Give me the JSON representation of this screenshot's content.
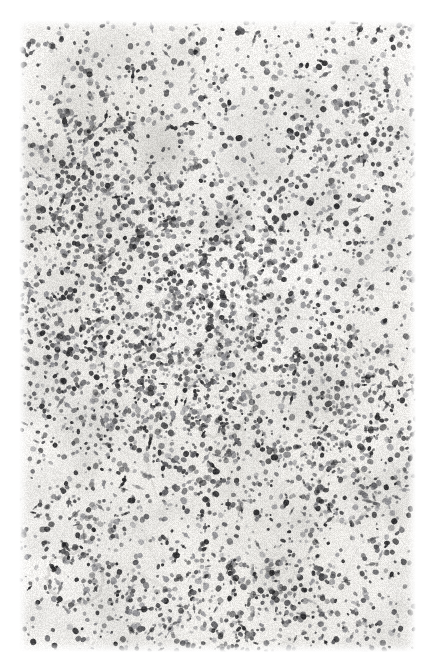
{
  "figure": {
    "domain": "Natural-Image",
    "kind": "histopathology-micrograph",
    "title": "Histological section photomicrograph",
    "description": "Low-power black-and-white photomicrograph of a haematoxylin-stained tissue section showing a diffuse mononuclear cell infiltrate with several rounded lymphoid follicle / granuloma-like aggregates.",
    "stain": "Haematoxylin and eosin (greyscale reproduction)",
    "visible_text": "",
    "label": ""
  },
  "canvas": {
    "width": 430,
    "height": 657,
    "page_background": "#ffffff",
    "slide_background": "#f7f6f4",
    "margins": {
      "left": 19,
      "right": 14,
      "top": 20,
      "bottom": 5
    }
  },
  "palette": {
    "page_white": "#ffffff",
    "slide_base": "#f6f5f3",
    "slide_warm_tint": "#f2f1ed",
    "nucleus_dark": "#2e2e30",
    "nucleus_mid": "#5e5e61",
    "nucleus_light": "#8e8e92",
    "stroma_haze": "#dedddb",
    "follicle_ring": "#cfcecb",
    "vessel_line": "#c4c3c0",
    "scan_streak": "#ecebe8"
  },
  "render": {
    "seed": 20240617,
    "nuclei_count": 5200,
    "haze_blob_count": 190,
    "fiber_count": 260,
    "grain_opacity": 0.055,
    "blur_px": 0.35
  },
  "features": [
    {
      "name": "follicle-upper-central",
      "type": "lymphoid-follicle",
      "cx": 186,
      "cy": 329,
      "r": 36,
      "ring_strength": 0.55,
      "center_density": 0.8,
      "note": "Rounded aggregate with pale centre and condensed rim of small dark nuclei"
    },
    {
      "name": "follicle-lower-central",
      "type": "granuloma-like-aggregate",
      "cx": 218,
      "cy": 404,
      "r": 34,
      "ring_strength": 0.45,
      "center_density": 1.25,
      "note": "Densely cellular nodular aggregate just below and right of the upper follicle"
    },
    {
      "name": "follicle-right-lower",
      "type": "lymphoid-follicle",
      "cx": 345,
      "cy": 494,
      "r": 30,
      "ring_strength": 0.5,
      "center_density": 0.75,
      "note": "Smaller ring-shaped aggregate in the lower right quadrant"
    },
    {
      "name": "follicle-mid-left",
      "type": "cell-aggregate",
      "cx": 120,
      "cy": 346,
      "r": 26,
      "ring_strength": 0.3,
      "center_density": 0.95,
      "note": "Ill-defined cluster at left of centre"
    },
    {
      "name": "vessel-lower-left",
      "type": "vessel-profile",
      "cx": 75,
      "cy": 578,
      "r": 28,
      "ring_strength": 0.6,
      "center_density": 0.25,
      "note": "Curved, nearly acellular vascular profile in sparse lower-left field"
    },
    {
      "name": "aggregate-upper-left",
      "type": "cell-aggregate",
      "cx": 96,
      "cy": 200,
      "r": 40,
      "ring_strength": 0.15,
      "center_density": 1.4,
      "note": "Broad zone of heavy mononuclear infiltration along the left third"
    },
    {
      "name": "aggregate-top-centre",
      "type": "cell-aggregate",
      "cx": 186,
      "cy": 96,
      "r": 44,
      "ring_strength": 0.12,
      "center_density": 1.3,
      "note": "Dense patch of nuclei at upper centre"
    },
    {
      "name": "aggregate-bottom-right",
      "type": "cell-aggregate",
      "cx": 320,
      "cy": 600,
      "r": 34,
      "ring_strength": 0.1,
      "center_density": 1.25,
      "note": "Clumped dark nuclei near bottom right margin"
    }
  ],
  "density_zones": [
    {
      "name": "left-band-dense",
      "cx": 95,
      "cy": 270,
      "rx": 95,
      "ry": 215,
      "weight": 1.55
    },
    {
      "name": "centre-moderate",
      "cx": 205,
      "cy": 330,
      "rx": 130,
      "ry": 210,
      "weight": 1.15
    },
    {
      "name": "upper-right-sparse",
      "cx": 350,
      "cy": 165,
      "rx": 95,
      "ry": 150,
      "weight": 0.52
    },
    {
      "name": "right-mid-moderate",
      "cx": 355,
      "cy": 420,
      "rx": 85,
      "ry": 140,
      "weight": 0.95
    },
    {
      "name": "lower-left-sparse",
      "cx": 90,
      "cy": 560,
      "rx": 85,
      "ry": 100,
      "weight": 0.45
    },
    {
      "name": "bottom-band-moderate",
      "cx": 255,
      "cy": 610,
      "rx": 175,
      "ry": 70,
      "weight": 1.0
    }
  ],
  "scan_artifacts": [
    {
      "name": "horizontal-streak-upper",
      "orientation": "horizontal",
      "pos": 78,
      "thickness": 4,
      "opacity": 0.3
    },
    {
      "name": "horizontal-streak-mid",
      "orientation": "horizontal",
      "pos": 232,
      "thickness": 3,
      "opacity": 0.22
    },
    {
      "name": "vertical-streak-centre",
      "orientation": "vertical",
      "pos": 246,
      "thickness": 7,
      "opacity": 0.26
    },
    {
      "name": "vertical-streak-right",
      "orientation": "vertical",
      "pos": 352,
      "thickness": 5,
      "opacity": 0.18
    }
  ]
}
